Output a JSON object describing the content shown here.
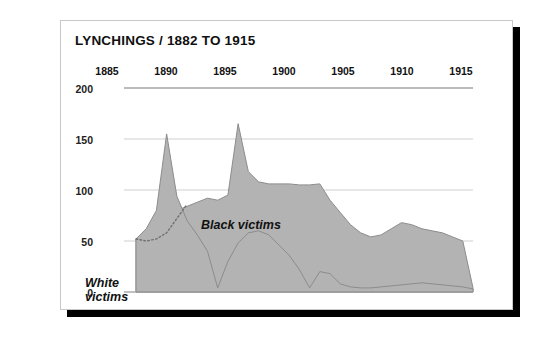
{
  "card": {
    "title": "LYNCHINGS / 1882 TO 1915"
  },
  "colors": {
    "area_fill": "#b3b3b3",
    "area_stroke": "#8c8c8c",
    "gridline": "#cfcfcf",
    "background": "#ffffff",
    "text": "#111111",
    "shadow": "#000000"
  },
  "chart_data": {
    "type": "area",
    "title": "LYNCHINGS / 1882 TO 1915",
    "xlabel": "",
    "ylabel": "",
    "xlim": [
      1882,
      1915
    ],
    "ylim": [
      0,
      200
    ],
    "yticks": [
      0,
      50,
      100,
      150,
      200
    ],
    "xticks": [
      1885,
      1890,
      1895,
      1900,
      1905,
      1910,
      1915
    ],
    "grid": true,
    "legend_position": "inline-annotations",
    "x_axis_position": "top",
    "series": [
      {
        "name": "Black victims",
        "label": "Black victims",
        "x": [
          1882,
          1883,
          1884,
          1885,
          1886,
          1887,
          1888,
          1889,
          1890,
          1891,
          1892,
          1893,
          1894,
          1895,
          1896,
          1897,
          1898,
          1899,
          1900,
          1901,
          1902,
          1903,
          1904,
          1905,
          1906,
          1907,
          1908,
          1909,
          1910,
          1911,
          1912,
          1913,
          1914,
          1915
        ],
        "values": [
          52,
          60,
          66,
          74,
          80,
          84,
          88,
          92,
          90,
          95,
          165,
          118,
          108,
          106,
          106,
          106,
          105,
          105,
          106,
          90,
          78,
          66,
          58,
          54,
          56,
          62,
          68,
          66,
          62,
          60,
          58,
          54,
          50,
          4
        ]
      },
      {
        "name": "White victims",
        "label": "White victims",
        "x": [
          1882,
          1883,
          1884,
          1885,
          1886,
          1887,
          1888,
          1889,
          1890,
          1891,
          1892,
          1893,
          1894,
          1895,
          1896,
          1897,
          1898,
          1899,
          1900,
          1901,
          1902,
          1903,
          1904,
          1905,
          1906,
          1907,
          1908,
          1909,
          1910,
          1911,
          1912,
          1913,
          1914,
          1915
        ],
        "values": [
          52,
          62,
          80,
          155,
          94,
          70,
          56,
          40,
          4,
          30,
          48,
          58,
          60,
          56,
          46,
          36,
          22,
          4,
          20,
          18,
          8,
          5,
          4,
          4,
          5,
          6,
          7,
          8,
          9,
          8,
          7,
          6,
          5,
          3
        ]
      }
    ],
    "hidden_segment": {
      "series": "White victims",
      "style": "dotted",
      "note": "Portion of the White victims curve drawn as a dotted line where it passes beneath the 1885 peak.",
      "x": [
        1882,
        1883,
        1884,
        1885,
        1886,
        1887
      ],
      "values": [
        52,
        50,
        52,
        58,
        72,
        86
      ]
    },
    "annotations": [
      {
        "text": "Black victims",
        "x": 1895.5,
        "y": 78
      },
      {
        "text": "White victims",
        "x": 1884.5,
        "y": 28
      }
    ]
  },
  "axis": {
    "yticks": [
      "200",
      "150",
      "100",
      "50",
      "0"
    ],
    "xticks": [
      "1885",
      "1890",
      "1895",
      "1900",
      "1905",
      "1910",
      "1915"
    ]
  },
  "labels": {
    "black_victims": "Black victims",
    "white_victims": "White\nvictims"
  }
}
